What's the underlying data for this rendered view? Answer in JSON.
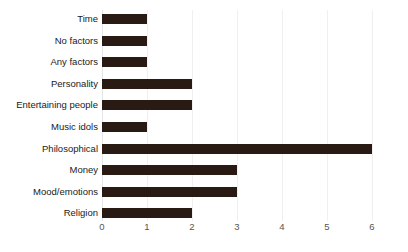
{
  "chart_data": {
    "type": "bar",
    "orientation": "horizontal",
    "title": "",
    "subtitle": "",
    "xlabel": "",
    "ylabel": "",
    "categories": [
      "Time",
      "No factors",
      "Any factors",
      "Personality",
      "Entertaining people",
      "Music idols",
      "Philosophical",
      "Money",
      "Mood/emotions",
      "Religion"
    ],
    "values": [
      1,
      1,
      1,
      2,
      2,
      1,
      6,
      3,
      3,
      2
    ],
    "xlim": [
      0,
      6
    ],
    "xticks": [
      0,
      1,
      2,
      3,
      4,
      5,
      6
    ],
    "xtick_labels": [
      "0",
      "1",
      "2",
      "3",
      "4",
      "5",
      "6"
    ],
    "grid": true,
    "grid_axis": "x",
    "legend": false,
    "legend_position": "none",
    "bar_color": "#2a1a14",
    "gridline_color": "#f0f0f0",
    "tick_label_color": "#555555",
    "category_label_color": "#1a1a1a",
    "background_color": "#ffffff"
  }
}
